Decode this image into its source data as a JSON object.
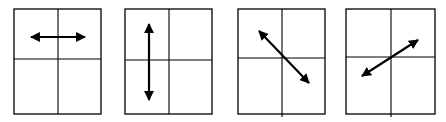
{
  "figure": {
    "stroke_color": "#000000",
    "background": "#ffffff",
    "panels": [
      {
        "id": "panel-1",
        "orientation": "horizontal",
        "box": {
          "x": 14,
          "y": 9,
          "w": 87,
          "h": 105
        },
        "divider_x": 58,
        "divider_y": 59,
        "divider_x_extend": 0,
        "arrow": {
          "x1": 31,
          "y1": 37,
          "x2": 85,
          "y2": 37
        }
      },
      {
        "id": "panel-2",
        "orientation": "vertical",
        "box": {
          "x": 125,
          "y": 9,
          "w": 87,
          "h": 105
        },
        "divider_x": 169,
        "divider_y": 60,
        "divider_x_extend": 0,
        "arrow": {
          "x1": 149,
          "y1": 24,
          "x2": 149,
          "y2": 100
        }
      },
      {
        "id": "panel-3",
        "orientation": "diagonal-down-right",
        "box": {
          "x": 238,
          "y": 9,
          "w": 87,
          "h": 105
        },
        "divider_x": 282,
        "divider_y": 58,
        "divider_x_extend": 3,
        "arrow": {
          "x1": 259,
          "y1": 31,
          "x2": 309,
          "y2": 83
        }
      },
      {
        "id": "panel-4",
        "orientation": "diagonal-up-right",
        "box": {
          "x": 346,
          "y": 9,
          "w": 89,
          "h": 105
        },
        "divider_x": 391,
        "divider_y": 57,
        "divider_x_extend": 3,
        "arrow": {
          "x1": 362,
          "y1": 76,
          "x2": 418,
          "y2": 40
        }
      }
    ]
  }
}
